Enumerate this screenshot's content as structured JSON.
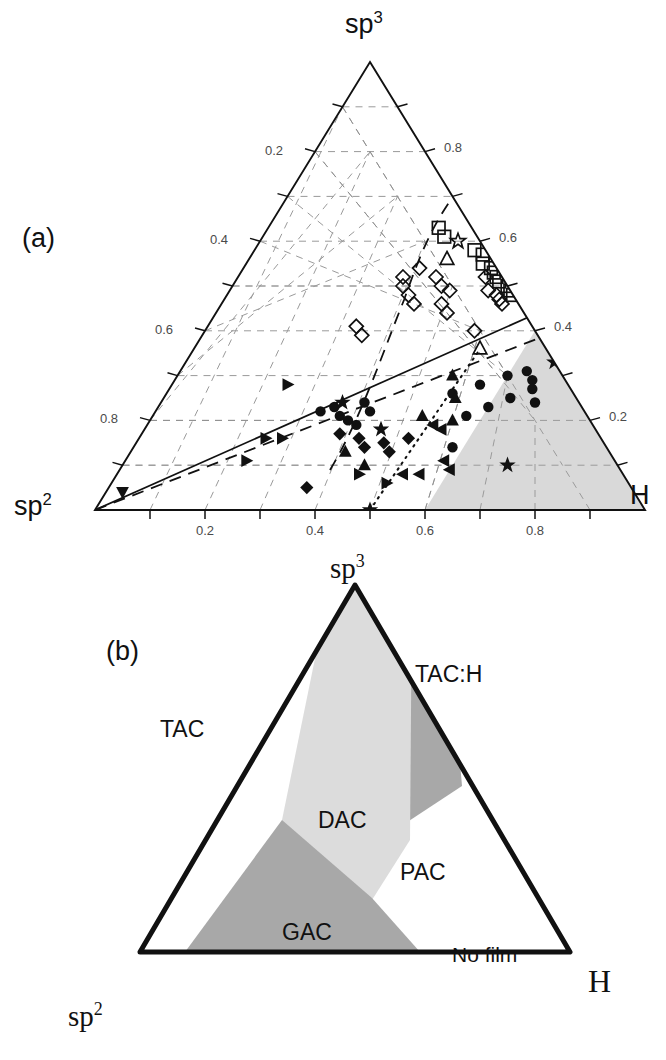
{
  "figure": {
    "panels": [
      {
        "tag": "(a)",
        "tag_pos": {
          "x": 22,
          "y": 225
        },
        "type": "ternary-scatter",
        "apex_top_label": "sp",
        "apex_top_sup": "3",
        "apex_left_label": "sp",
        "apex_left_sup": "2",
        "apex_right_label": "H",
        "font_style": "sans",
        "axis_left_ticks": [
          "0.2",
          "0.4",
          "0.6",
          "0.8"
        ],
        "axis_right_ticks": [
          "0.8",
          "0.6",
          "0.4",
          "0.2"
        ],
        "axis_bottom_ticks": [
          "0.2",
          "0.4",
          "0.6",
          "0.8"
        ]
      },
      {
        "tag": "(b)",
        "tag_pos": {
          "x": 106,
          "y": 638
        },
        "type": "ternary-regions",
        "apex_top_label": "sp",
        "apex_top_sup": "3",
        "apex_left_label": "sp",
        "apex_left_sup": "2",
        "apex_right_label": "H",
        "font_style": "serif",
        "regions": [
          {
            "name": "TAC",
            "label": "TAC",
            "shade": "none",
            "label_pos": {
              "x": 160,
              "y": 718
            }
          },
          {
            "name": "TAC:H",
            "label": "TAC:H",
            "shade": "dark",
            "label_pos": {
              "x": 415,
              "y": 663
            }
          },
          {
            "name": "DAC",
            "label": "DAC",
            "shade": "light",
            "label_pos": {
              "x": 318,
              "y": 809
            }
          },
          {
            "name": "PAC",
            "label": "PAC",
            "shade": "none",
            "label_pos": {
              "x": 400,
              "y": 861
            }
          },
          {
            "name": "GAC",
            "label": "GAC",
            "shade": "dark",
            "label_pos": {
              "x": 282,
              "y": 921
            }
          },
          {
            "name": "No film",
            "label": "No film",
            "shade": "none",
            "label_pos": {
              "x": 452,
              "y": 944
            }
          }
        ]
      }
    ]
  },
  "colors": {
    "ink": "#111111",
    "grid": "#9a9a9a",
    "tick_text": "#4a4a4a",
    "shade_light": "#dcdcdc",
    "shade_mid": "#c8c8c8",
    "shade_dark": "#a8a8a8",
    "background": "#ffffff"
  },
  "chart_data": [
    {
      "id": "panel-a",
      "type": "scatter",
      "coordinate_system": "ternary",
      "title": "",
      "subtitle": "",
      "axes": {
        "top_vertex": "sp3",
        "left_vertex": "sp2",
        "right_vertex": "H",
        "left_axis_label": "sp3 fraction",
        "right_axis_label": "H fraction",
        "bottom_axis_label": "H fraction",
        "left_ticks": [
          0.2,
          0.4,
          0.6,
          0.8
        ],
        "right_ticks": [
          0.8,
          0.6,
          0.4,
          0.2
        ],
        "bottom_ticks": [
          0.2,
          0.4,
          0.6,
          0.8
        ],
        "range": [
          0,
          1
        ],
        "grid": true
      },
      "legend": {
        "position": "none",
        "entries": []
      },
      "annotations": [
        {
          "kind": "shaded-region",
          "label": "no-film region",
          "shade": "light",
          "location": "lower-right corner"
        },
        {
          "kind": "line",
          "style": "solid",
          "from_ternary": {
            "sp2": 1.0,
            "sp3": 0.0,
            "H": 0.0
          },
          "to_ternary": {
            "sp2": 0.0,
            "sp3": 0.4,
            "H": 0.6
          }
        },
        {
          "kind": "line",
          "style": "dashed",
          "from_ternary": {
            "sp2": 1.0,
            "sp3": 0.0,
            "H": 0.0
          },
          "to_ternary": {
            "sp2": 0.0,
            "sp3": 0.36,
            "H": 0.64
          }
        },
        {
          "kind": "line",
          "style": "dashed",
          "label": "upper boundary",
          "from_ternary": {
            "sp2": 0.3,
            "sp3": 0.2,
            "H": 0.5
          },
          "to_ternary": {
            "sp2": 0.1,
            "sp3": 0.58,
            "H": 0.32
          }
        },
        {
          "kind": "line",
          "style": "dotted",
          "from_ternary": {
            "sp2": 0.5,
            "sp3": 0.0,
            "H": 0.5
          },
          "to_ternary": {
            "sp2": 0.12,
            "sp3": 0.32,
            "H": 0.56
          }
        }
      ],
      "series": [
        {
          "name": "open-diamond",
          "marker": "diamond-open",
          "points": [
            {
              "sp3": 0.52,
              "H": 0.3
            },
            {
              "sp3": 0.54,
              "H": 0.32
            },
            {
              "sp3": 0.5,
              "H": 0.31
            },
            {
              "sp3": 0.48,
              "H": 0.33
            },
            {
              "sp3": 0.46,
              "H": 0.35
            },
            {
              "sp3": 0.52,
              "H": 0.36
            },
            {
              "sp3": 0.5,
              "H": 0.38
            },
            {
              "sp3": 0.49,
              "H": 0.4
            },
            {
              "sp3": 0.46,
              "H": 0.4
            },
            {
              "sp3": 0.44,
              "H": 0.42
            },
            {
              "sp3": 0.41,
              "H": 0.27
            },
            {
              "sp3": 0.39,
              "H": 0.29
            },
            {
              "sp3": 0.52,
              "H": 0.45
            },
            {
              "sp3": 0.49,
              "H": 0.47
            },
            {
              "sp3": 0.48,
              "H": 0.49
            },
            {
              "sp3": 0.47,
              "H": 0.5
            },
            {
              "sp3": 0.46,
              "H": 0.51
            },
            {
              "sp3": 0.4,
              "H": 0.49
            }
          ]
        },
        {
          "name": "open-square",
          "marker": "square-open",
          "points": [
            {
              "sp3": 0.58,
              "H": 0.4
            },
            {
              "sp3": 0.57,
              "H": 0.42
            },
            {
              "sp3": 0.55,
              "H": 0.43
            },
            {
              "sp3": 0.54,
              "H": 0.45
            },
            {
              "sp3": 0.53,
              "H": 0.46
            },
            {
              "sp3": 0.52,
              "H": 0.47
            },
            {
              "sp3": 0.51,
              "H": 0.48
            },
            {
              "sp3": 0.5,
              "H": 0.5
            },
            {
              "sp3": 0.49,
              "H": 0.51
            },
            {
              "sp3": 0.48,
              "H": 0.52
            },
            {
              "sp3": 0.55,
              "H": 0.55
            },
            {
              "sp3": 0.53,
              "H": 0.57
            },
            {
              "sp3": 0.63,
              "H": 0.31
            },
            {
              "sp3": 0.61,
              "H": 0.33
            }
          ]
        },
        {
          "name": "open-triangle-up",
          "marker": "triangle-up-open",
          "points": [
            {
              "sp3": 0.56,
              "H": 0.36
            },
            {
              "sp3": 0.36,
              "H": 0.52
            }
          ]
        },
        {
          "name": "open-star",
          "marker": "star-open",
          "points": [
            {
              "sp3": 0.6,
              "H": 0.36
            }
          ]
        },
        {
          "name": "filled-circle",
          "marker": "circle-filled",
          "points": [
            {
              "sp3": 0.22,
              "H": 0.3
            },
            {
              "sp3": 0.23,
              "H": 0.32
            },
            {
              "sp3": 0.21,
              "H": 0.34
            },
            {
              "sp3": 0.2,
              "H": 0.36
            },
            {
              "sp3": 0.19,
              "H": 0.38
            },
            {
              "sp3": 0.24,
              "H": 0.37
            },
            {
              "sp3": 0.22,
              "H": 0.39
            },
            {
              "sp3": 0.26,
              "H": 0.52
            },
            {
              "sp3": 0.28,
              "H": 0.56
            },
            {
              "sp3": 0.3,
              "H": 0.6
            },
            {
              "sp3": 0.31,
              "H": 0.63
            },
            {
              "sp3": 0.29,
              "H": 0.65
            },
            {
              "sp3": 0.27,
              "H": 0.66
            },
            {
              "sp3": 0.25,
              "H": 0.63
            },
            {
              "sp3": 0.23,
              "H": 0.6
            },
            {
              "sp3": 0.21,
              "H": 0.57
            },
            {
              "sp3": 0.24,
              "H": 0.68
            },
            {
              "sp3": 0.14,
              "H": 0.58
            }
          ]
        },
        {
          "name": "filled-diamond",
          "marker": "diamond-filled",
          "points": [
            {
              "sp3": 0.17,
              "H": 0.36
            },
            {
              "sp3": 0.16,
              "H": 0.4
            },
            {
              "sp3": 0.14,
              "H": 0.42
            },
            {
              "sp3": 0.15,
              "H": 0.45
            },
            {
              "sp3": 0.13,
              "H": 0.47
            },
            {
              "sp3": 0.16,
              "H": 0.49
            },
            {
              "sp3": 0.05,
              "H": 0.36
            }
          ]
        },
        {
          "name": "filled-triangle-right",
          "marker": "triangle-right-filled",
          "points": [
            {
              "sp3": 0.28,
              "H": 0.21
            },
            {
              "sp3": 0.16,
              "H": 0.23
            },
            {
              "sp3": 0.16,
              "H": 0.26
            },
            {
              "sp3": 0.11,
              "H": 0.22
            },
            {
              "sp3": 0.08,
              "H": 0.44
            },
            {
              "sp3": 0.06,
              "H": 0.5
            }
          ]
        },
        {
          "name": "filled-triangle-left",
          "marker": "triangle-left-filled",
          "points": [
            {
              "sp3": 0.19,
              "H": 0.52
            },
            {
              "sp3": 0.18,
              "H": 0.54
            },
            {
              "sp3": 0.08,
              "H": 0.52
            },
            {
              "sp3": 0.08,
              "H": 0.55
            },
            {
              "sp3": 0.11,
              "H": 0.58
            },
            {
              "sp3": 0.09,
              "H": 0.6
            }
          ]
        },
        {
          "name": "filled-triangle-up",
          "marker": "triangle-up-filled",
          "points": [
            {
              "sp3": 0.3,
              "H": 0.5
            },
            {
              "sp3": 0.21,
              "H": 0.49
            },
            {
              "sp3": 0.2,
              "H": 0.55
            },
            {
              "sp3": 0.13,
              "H": 0.39
            },
            {
              "sp3": 0.1,
              "H": 0.44
            },
            {
              "sp3": 0.25,
              "H": 0.53
            }
          ]
        },
        {
          "name": "filled-triangle-down",
          "marker": "triangle-down-filled",
          "points": [
            {
              "sp3": 0.04,
              "H": 0.03
            }
          ]
        },
        {
          "name": "filled-star",
          "marker": "star-filled",
          "points": [
            {
              "sp3": 0.18,
              "H": 0.43
            },
            {
              "sp3": 0.33,
              "H": 0.67
            },
            {
              "sp3": 0.1,
              "H": 0.7
            },
            {
              "sp3": 0.0,
              "H": 0.5
            },
            {
              "sp3": 0.24,
              "H": 0.33
            }
          ]
        }
      ]
    },
    {
      "id": "panel-b",
      "type": "table",
      "coordinate_system": "ternary",
      "title": "",
      "axes": {
        "top_vertex": "sp3",
        "left_vertex": "sp2",
        "right_vertex": "H",
        "grid": false
      },
      "legend": {
        "position": "inline-labels"
      },
      "regions": [
        {
          "name": "TAC",
          "shade": "none",
          "description": "tetrahedral amorphous carbon, low H, left side"
        },
        {
          "name": "TAC:H",
          "shade": "dark",
          "description": "hydrogenated tetrahedral amorphous carbon, near sp3 apex"
        },
        {
          "name": "DAC",
          "shade": "light",
          "description": "diamond-like amorphous carbon, central band"
        },
        {
          "name": "PAC",
          "shade": "none",
          "description": "polymer-like amorphous carbon, right of DAC"
        },
        {
          "name": "GAC",
          "shade": "dark",
          "description": "graphite-like amorphous carbon, lower band"
        },
        {
          "name": "No film",
          "shade": "none",
          "description": "no film deposition, high H corner"
        }
      ]
    }
  ]
}
